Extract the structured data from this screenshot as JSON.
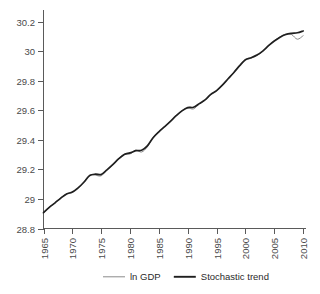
{
  "chart_data": {
    "type": "line",
    "title": "",
    "xlabel": "",
    "ylabel": "",
    "xlim": [
      1965,
      2010.5
    ],
    "ylim": [
      28.8,
      30.28
    ],
    "grid": false,
    "legend_position": "bottom",
    "x_ticks": [
      "1965",
      "1970",
      "1975",
      "1980",
      "1985",
      "1990",
      "1995",
      "2000",
      "2005",
      "2010"
    ],
    "x_tick_values": [
      1965,
      1970,
      1975,
      1980,
      1985,
      1990,
      1995,
      2000,
      2005,
      2010
    ],
    "y_ticks": [
      "28.8",
      "29",
      "29.2",
      "29.4",
      "29.6",
      "29.8",
      "30",
      "30.2"
    ],
    "y_tick_values": [
      28.8,
      29,
      29.2,
      29.4,
      29.6,
      29.8,
      30,
      30.2
    ],
    "x": [
      1965,
      1966,
      1967,
      1968,
      1969,
      1970,
      1971,
      1972,
      1973,
      1974,
      1975,
      1976,
      1977,
      1978,
      1979,
      1980,
      1981,
      1982,
      1983,
      1984,
      1985,
      1986,
      1987,
      1988,
      1989,
      1990,
      1991,
      1992,
      1993,
      1994,
      1995,
      1996,
      1997,
      1998,
      1999,
      2000,
      2001,
      2002,
      2003,
      2004,
      2005,
      2006,
      2007,
      2008,
      2009,
      2010
    ],
    "series": [
      {
        "name": "ln GDP",
        "color": "#8a8a8a",
        "width": 1,
        "values": [
          28.905,
          28.945,
          28.972,
          29.008,
          29.035,
          29.043,
          29.072,
          29.116,
          29.163,
          29.161,
          29.157,
          29.196,
          29.231,
          29.273,
          29.303,
          29.305,
          29.331,
          29.318,
          29.353,
          29.418,
          29.456,
          29.49,
          29.525,
          29.565,
          29.598,
          29.616,
          29.61,
          29.643,
          29.669,
          29.708,
          29.733,
          29.77,
          29.814,
          29.857,
          29.904,
          29.944,
          29.954,
          29.972,
          30.0,
          30.038,
          30.071,
          30.098,
          30.117,
          30.114,
          30.082,
          30.106
        ]
      },
      {
        "name": "Stochastic trend",
        "color": "#1f1f1f",
        "width": 1.7,
        "values": [
          28.908,
          28.943,
          28.974,
          29.006,
          29.034,
          29.047,
          29.075,
          29.113,
          29.158,
          29.168,
          29.166,
          29.197,
          29.232,
          29.271,
          29.302,
          29.312,
          29.327,
          29.33,
          29.36,
          29.415,
          29.455,
          29.49,
          29.526,
          29.564,
          29.597,
          29.619,
          29.621,
          29.646,
          29.671,
          29.708,
          29.734,
          29.771,
          29.814,
          29.857,
          29.903,
          29.943,
          29.957,
          29.975,
          30.002,
          30.038,
          30.07,
          30.096,
          30.114,
          30.122,
          30.126,
          30.138
        ]
      }
    ],
    "legend": [
      {
        "label": "ln GDP",
        "color": "#8a8a8a",
        "width": 1
      },
      {
        "label": "Stochastic trend",
        "color": "#1f1f1f",
        "width": 1.9
      }
    ],
    "axis_color": "#5a5a5a",
    "background": "#ffffff"
  }
}
